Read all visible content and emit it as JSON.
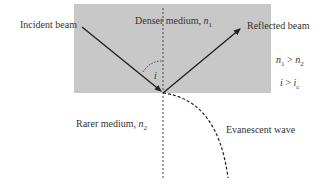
{
  "diagram": {
    "labels": {
      "incident": "Incident beam",
      "reflected": "Reflected beam",
      "denser_prefix": "Denser medium, ",
      "denser_symbol": "n",
      "denser_sub": "1",
      "rarer_prefix": "Rarer medium, ",
      "rarer_symbol": "n",
      "rarer_sub": "2",
      "evanescent": "Evanescent wave",
      "angle": "i",
      "cond1_a": "n",
      "cond1_a_sub": "1",
      "cond1_op": " > ",
      "cond1_b": "n",
      "cond1_b_sub": "2",
      "cond2_a": "i",
      "cond2_op": " > ",
      "cond2_b": "i",
      "cond2_b_sub": "c"
    },
    "colors": {
      "denser_fill": "#c8c8c8",
      "line": "#222222",
      "background": "#ffffff"
    }
  }
}
